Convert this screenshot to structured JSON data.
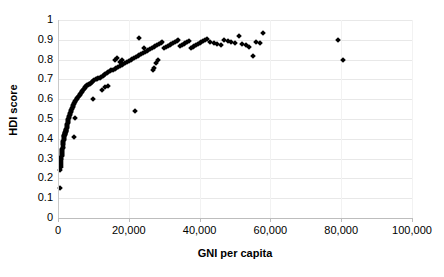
{
  "chart_data": {
    "type": "scatter",
    "title": "",
    "xlabel": "GNI per capita",
    "ylabel": "HDI score",
    "xlim": [
      0,
      100000
    ],
    "ylim": [
      0,
      1
    ],
    "grid": true,
    "legend": null,
    "x_tick_labels": [
      "0",
      "20,000",
      "40,000",
      "60,000",
      "80,000",
      "100,000"
    ],
    "x_ticks": [
      0,
      20000,
      40000,
      60000,
      80000,
      100000
    ],
    "y_tick_labels": [
      "0",
      "0.1",
      "0.2",
      "0.3",
      "0.4",
      "0.5",
      "0.6",
      "0.7",
      "0.8",
      "0.9",
      "1"
    ],
    "y_ticks": [
      0,
      0.1,
      0.2,
      0.3,
      0.4,
      0.5,
      0.6,
      0.7,
      0.8,
      0.9,
      1
    ],
    "marker": "diamond",
    "marker_color": "#000000",
    "series": [
      {
        "name": "Countries",
        "points": [
          [
            600,
            0.15
          ],
          [
            700,
            0.24
          ],
          [
            750,
            0.26
          ],
          [
            800,
            0.27
          ],
          [
            820,
            0.28
          ],
          [
            860,
            0.29
          ],
          [
            900,
            0.3
          ],
          [
            950,
            0.3
          ],
          [
            980,
            0.31
          ],
          [
            1000,
            0.315
          ],
          [
            1050,
            0.32
          ],
          [
            1080,
            0.325
          ],
          [
            1100,
            0.33
          ],
          [
            1150,
            0.335
          ],
          [
            1180,
            0.34
          ],
          [
            1200,
            0.345
          ],
          [
            1250,
            0.35
          ],
          [
            1300,
            0.355
          ],
          [
            1320,
            0.36
          ],
          [
            1350,
            0.37
          ],
          [
            1400,
            0.375
          ],
          [
            1450,
            0.38
          ],
          [
            1500,
            0.385
          ],
          [
            1550,
            0.39
          ],
          [
            1580,
            0.395
          ],
          [
            1600,
            0.4
          ],
          [
            1650,
            0.405
          ],
          [
            1700,
            0.41
          ],
          [
            1750,
            0.412
          ],
          [
            1780,
            0.415
          ],
          [
            1800,
            0.418
          ],
          [
            1850,
            0.42
          ],
          [
            1900,
            0.422
          ],
          [
            1950,
            0.425
          ],
          [
            2000,
            0.428
          ],
          [
            2050,
            0.43
          ],
          [
            2100,
            0.432
          ],
          [
            2150,
            0.435
          ],
          [
            2200,
            0.438
          ],
          [
            2250,
            0.44
          ],
          [
            2300,
            0.442
          ],
          [
            2350,
            0.445
          ],
          [
            2400,
            0.45
          ],
          [
            2450,
            0.455
          ],
          [
            2500,
            0.46
          ],
          [
            2550,
            0.465
          ],
          [
            4600,
            0.41
          ],
          [
            2600,
            0.47
          ],
          [
            2650,
            0.475
          ],
          [
            2700,
            0.48
          ],
          [
            2750,
            0.485
          ],
          [
            2800,
            0.49
          ],
          [
            2850,
            0.495
          ],
          [
            2900,
            0.5
          ],
          [
            3000,
            0.505
          ],
          [
            3100,
            0.51
          ],
          [
            3200,
            0.515
          ],
          [
            4900,
            0.505
          ],
          [
            3300,
            0.52
          ],
          [
            3400,
            0.525
          ],
          [
            3500,
            0.53
          ],
          [
            3600,
            0.535
          ],
          [
            3700,
            0.54
          ],
          [
            3800,
            0.545
          ],
          [
            3900,
            0.55
          ],
          [
            4000,
            0.555
          ],
          [
            4100,
            0.56
          ],
          [
            4200,
            0.565
          ],
          [
            4300,
            0.57
          ],
          [
            4400,
            0.575
          ],
          [
            4500,
            0.58
          ],
          [
            4700,
            0.585
          ],
          [
            4900,
            0.59
          ],
          [
            5100,
            0.595
          ],
          [
            5300,
            0.6
          ],
          [
            5500,
            0.605
          ],
          [
            5700,
            0.61
          ],
          [
            5900,
            0.615
          ],
          [
            6100,
            0.62
          ],
          [
            6300,
            0.625
          ],
          [
            6500,
            0.63
          ],
          [
            6700,
            0.635
          ],
          [
            6900,
            0.64
          ],
          [
            7100,
            0.645
          ],
          [
            7300,
            0.65
          ],
          [
            7500,
            0.655
          ],
          [
            7700,
            0.66
          ],
          [
            7900,
            0.665
          ],
          [
            8200,
            0.67
          ],
          [
            8500,
            0.672
          ],
          [
            8800,
            0.675
          ],
          [
            9100,
            0.678
          ],
          [
            9400,
            0.68
          ],
          [
            9700,
            0.685
          ],
          [
            10000,
            0.69
          ],
          [
            10300,
            0.695
          ],
          [
            10600,
            0.7
          ],
          [
            11000,
            0.702
          ],
          [
            11400,
            0.705
          ],
          [
            11800,
            0.708
          ],
          [
            12200,
            0.71
          ],
          [
            12600,
            0.715
          ],
          [
            13000,
            0.72
          ],
          [
            13400,
            0.725
          ],
          [
            13800,
            0.73
          ],
          [
            14200,
            0.735
          ],
          [
            14600,
            0.74
          ],
          [
            15000,
            0.745
          ],
          [
            9800,
            0.6
          ],
          [
            21800,
            0.54
          ],
          [
            12500,
            0.645
          ],
          [
            13200,
            0.66
          ],
          [
            14000,
            0.665
          ],
          [
            15500,
            0.75
          ],
          [
            16000,
            0.755
          ],
          [
            16500,
            0.76
          ],
          [
            17000,
            0.765
          ],
          [
            17500,
            0.77
          ],
          [
            18000,
            0.775
          ],
          [
            18500,
            0.78
          ],
          [
            19000,
            0.785
          ],
          [
            19500,
            0.79
          ],
          [
            20000,
            0.795
          ],
          [
            16200,
            0.8
          ],
          [
            16800,
            0.81
          ],
          [
            17400,
            0.79
          ],
          [
            18200,
            0.8
          ],
          [
            20500,
            0.8
          ],
          [
            21000,
            0.805
          ],
          [
            21500,
            0.81
          ],
          [
            22000,
            0.815
          ],
          [
            22500,
            0.82
          ],
          [
            23000,
            0.825
          ],
          [
            23500,
            0.83
          ],
          [
            24000,
            0.835
          ],
          [
            24500,
            0.84
          ],
          [
            25000,
            0.845
          ],
          [
            22800,
            0.91
          ],
          [
            24200,
            0.86
          ],
          [
            25500,
            0.85
          ],
          [
            26000,
            0.855
          ],
          [
            26500,
            0.86
          ],
          [
            27000,
            0.865
          ],
          [
            27500,
            0.87
          ],
          [
            28000,
            0.875
          ],
          [
            28500,
            0.88
          ],
          [
            29000,
            0.885
          ],
          [
            26800,
            0.745
          ],
          [
            27200,
            0.76
          ],
          [
            27600,
            0.785
          ],
          [
            28200,
            0.8
          ],
          [
            29500,
            0.89
          ],
          [
            30000,
            0.86
          ],
          [
            30500,
            0.865
          ],
          [
            31000,
            0.87
          ],
          [
            31500,
            0.875
          ],
          [
            32000,
            0.88
          ],
          [
            32500,
            0.885
          ],
          [
            33000,
            0.89
          ],
          [
            33500,
            0.895
          ],
          [
            34000,
            0.9
          ],
          [
            34500,
            0.87
          ],
          [
            35000,
            0.875
          ],
          [
            35500,
            0.88
          ],
          [
            36000,
            0.885
          ],
          [
            36500,
            0.89
          ],
          [
            37000,
            0.895
          ],
          [
            37500,
            0.86
          ],
          [
            38000,
            0.865
          ],
          [
            38500,
            0.87
          ],
          [
            39000,
            0.875
          ],
          [
            39500,
            0.88
          ],
          [
            40000,
            0.885
          ],
          [
            40500,
            0.89
          ],
          [
            41000,
            0.895
          ],
          [
            41500,
            0.9
          ],
          [
            42000,
            0.905
          ],
          [
            43000,
            0.89
          ],
          [
            44000,
            0.885
          ],
          [
            45000,
            0.88
          ],
          [
            46000,
            0.875
          ],
          [
            47000,
            0.9
          ],
          [
            48000,
            0.895
          ],
          [
            49000,
            0.89
          ],
          [
            50000,
            0.885
          ],
          [
            51000,
            0.92
          ],
          [
            52000,
            0.88
          ],
          [
            53000,
            0.875
          ],
          [
            54000,
            0.865
          ],
          [
            55000,
            0.82
          ],
          [
            56000,
            0.89
          ],
          [
            57000,
            0.885
          ],
          [
            58000,
            0.935
          ],
          [
            79000,
            0.9
          ],
          [
            80500,
            0.8
          ]
        ]
      }
    ]
  },
  "axes": {
    "x_title": "GNI per capita",
    "y_title": "HDI score"
  }
}
